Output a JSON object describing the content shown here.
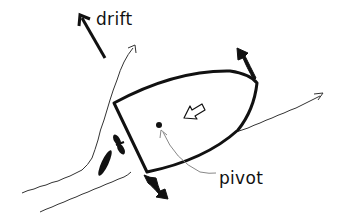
{
  "diagram": {
    "labels": {
      "drift": "drift",
      "pivot": "pivot"
    },
    "elements": [
      {
        "name": "boat-hull",
        "type": "outline"
      },
      {
        "name": "pivot-point",
        "type": "dot"
      },
      {
        "name": "drift-arrow",
        "type": "arrow",
        "direction": "up-left"
      },
      {
        "name": "hollow-arrow",
        "type": "arrow",
        "direction": "toward-stern"
      },
      {
        "name": "bow-rotation-arrow",
        "type": "curved-arrow"
      },
      {
        "name": "stern-rotation-arrow",
        "type": "curved-arrow"
      },
      {
        "name": "propeller",
        "type": "icon"
      },
      {
        "name": "rudder",
        "type": "icon"
      },
      {
        "name": "wake-lines",
        "type": "wavy-arrows",
        "count": 3
      }
    ],
    "colors": {
      "ink": "#111111",
      "background": "#ffffff",
      "leader": "#888888"
    }
  }
}
